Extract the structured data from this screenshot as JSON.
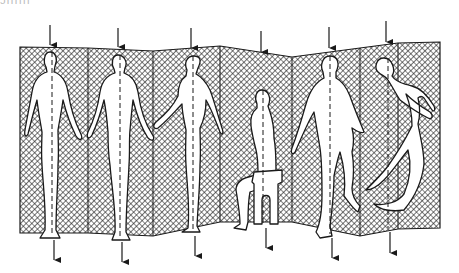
{
  "illustration": {
    "subject": "Folding screen with six human figures and vertical axis markers",
    "caption_fragment": "ɔıııııı",
    "colors": {
      "background": "#ffffff",
      "ink": "#1a1a1a",
      "figure_fill": "#ffffff"
    },
    "screen": {
      "panel_count": 7,
      "fold_x": [
        20,
        88,
        153,
        220,
        292,
        360,
        398,
        440
      ],
      "top_y": [
        47,
        48,
        51,
        46,
        57,
        48,
        43,
        42
      ],
      "bottom_y": [
        233,
        233,
        236,
        222,
        222,
        236,
        228,
        228
      ],
      "texture": "crosshatch"
    },
    "figures": [
      {
        "id": 1,
        "pose": "standing-front",
        "axis_x": 52
      },
      {
        "id": 2,
        "pose": "standing-back",
        "axis_x": 120
      },
      {
        "id": 3,
        "pose": "standing-side",
        "axis_x": 193
      },
      {
        "id": 4,
        "pose": "seated-on-stool",
        "axis_x": 263
      },
      {
        "id": 5,
        "pose": "walking",
        "axis_x": 330
      },
      {
        "id": 6,
        "pose": "running",
        "axis_x": 388
      }
    ],
    "arrows_top": [
      {
        "x": 50,
        "y1": 25,
        "y2": 45
      },
      {
        "x": 118,
        "y1": 28,
        "y2": 47
      },
      {
        "x": 191,
        "y1": 28,
        "y2": 48
      },
      {
        "x": 261,
        "y1": 31,
        "y2": 52
      },
      {
        "x": 329,
        "y1": 27,
        "y2": 48
      },
      {
        "x": 386,
        "y1": 21,
        "y2": 42
      }
    ],
    "arrows_bottom": [
      {
        "x": 54,
        "y1": 238,
        "y2": 260
      },
      {
        "x": 122,
        "y1": 240,
        "y2": 262
      },
      {
        "x": 195,
        "y1": 235,
        "y2": 256
      },
      {
        "x": 266,
        "y1": 226,
        "y2": 248
      },
      {
        "x": 332,
        "y1": 238,
        "y2": 258
      },
      {
        "x": 390,
        "y1": 231,
        "y2": 253
      }
    ]
  }
}
